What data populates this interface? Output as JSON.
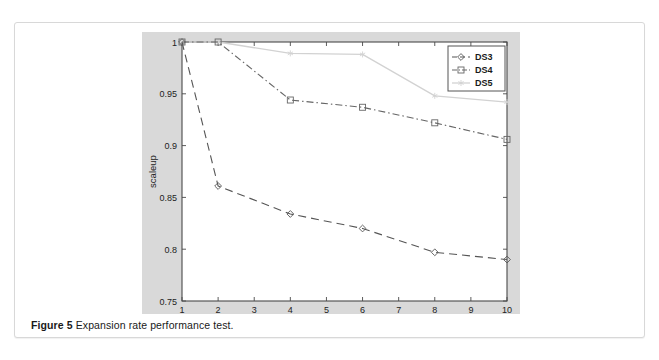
{
  "figure": {
    "caption_label": "Figure 5",
    "caption_text": "Expansion rate performance test."
  },
  "colors": {
    "plot_background": "#d9d9d9",
    "axes_background": "#ffffff",
    "axis_line": "#4a4a4a",
    "ds3": "#555555",
    "ds4": "#666666",
    "ds5": "#d2d2d2",
    "legend_border": "#555555",
    "card_border": "#d8d8d8",
    "tick_label": "#222222"
  },
  "chart_data": {
    "type": "line",
    "title": "",
    "xlabel": "number of nodes",
    "ylabel": "scaleup",
    "x": [
      1,
      2,
      4,
      6,
      8,
      10
    ],
    "xlim": [
      1,
      10
    ],
    "ylim": [
      0.75,
      1.0
    ],
    "xticks": [
      1,
      2,
      3,
      4,
      5,
      6,
      7,
      8,
      9,
      10
    ],
    "xtick_labels": [
      "1",
      "2",
      "3",
      "4",
      "5",
      "6",
      "7",
      "8",
      "9",
      "10"
    ],
    "yticks": [
      0.75,
      0.8,
      0.85,
      0.9,
      0.95,
      1.0
    ],
    "ytick_labels": [
      "0.75",
      "0.8",
      "0.85",
      "0.9",
      "0.95",
      "1"
    ],
    "grid": false,
    "legend_position": "upper right",
    "series": [
      {
        "name": "DS3",
        "values": [
          1.0,
          0.861,
          0.834,
          0.82,
          0.797,
          0.79
        ],
        "color": "#555555",
        "marker": "diamond",
        "linestyle": "dashed"
      },
      {
        "name": "DS4",
        "values": [
          1.0,
          1.0,
          0.944,
          0.937,
          0.922,
          0.906
        ],
        "color": "#666666",
        "marker": "square",
        "linestyle": "dashdot"
      },
      {
        "name": "DS5",
        "values": [
          1.0,
          1.0,
          0.989,
          0.988,
          0.948,
          0.942
        ],
        "color": "#d2d2d2",
        "marker": "star",
        "linestyle": "solid"
      }
    ]
  }
}
